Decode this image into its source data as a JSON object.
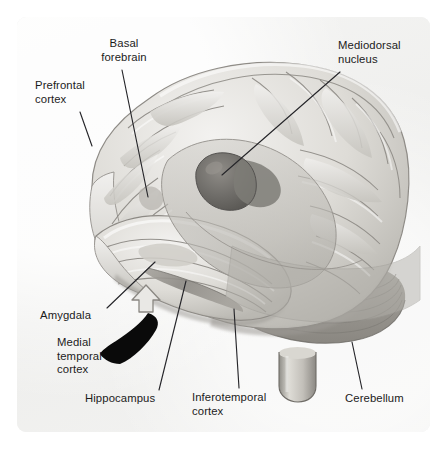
{
  "figure": {
    "background_color": "#ffffff",
    "panel_color": "#f2f2f1"
  },
  "colors": {
    "leader_line": "#26262a",
    "label_text": "#1b1b1b",
    "cortex_light": "#e8e7e4",
    "cortex_mid": "#c9c7c2",
    "cortex_shadow": "#9b9893",
    "cerebellum": "#9a9892",
    "nucleus_dark": "#6f6d69",
    "overlay_translucent": "#b9b7b1",
    "arrow_black": "#0a0a0a",
    "arrow_gray_outline": "#8d8a85"
  },
  "labels": [
    {
      "id": "basal-forebrain",
      "text": "Basal\nforebrain",
      "align": "center",
      "x": 89,
      "y": 37,
      "leader": {
        "x1": 122,
        "y1": 70,
        "x2": 148,
        "y2": 197
      }
    },
    {
      "id": "prefrontal-cortex",
      "text": "Prefrontal\ncortex",
      "align": "left",
      "x": 35,
      "y": 79,
      "leader": {
        "x1": 80,
        "y1": 112,
        "x2": 92,
        "y2": 146
      }
    },
    {
      "id": "mediodorsal-nucleus",
      "text": "Mediodorsal\nnucleus",
      "align": "left",
      "x": 338,
      "y": 39,
      "leader": {
        "x1": 340,
        "y1": 72,
        "x2": 222,
        "y2": 175
      }
    },
    {
      "id": "amygdala",
      "text": "Amygdala",
      "align": "left",
      "x": 40,
      "y": 309,
      "leader": {
        "x1": 107,
        "y1": 308,
        "x2": 155,
        "y2": 262
      }
    },
    {
      "id": "medial-temporal-cortex",
      "text": "Medial\ntemporal\ncortex",
      "align": "left",
      "x": 57,
      "y": 336,
      "wedge": {
        "x": 126,
        "y": 330,
        "w": 44,
        "h": 42
      }
    },
    {
      "id": "hippocampus",
      "text": "Hippocampus",
      "align": "left",
      "x": 85,
      "y": 392,
      "leader": {
        "x1": 159,
        "y1": 390,
        "x2": 186,
        "y2": 281
      }
    },
    {
      "id": "inferotemporal-cortex",
      "text": "Inferotemporal\ncortex",
      "align": "left",
      "x": 192,
      "y": 391,
      "leader": {
        "x1": 239,
        "y1": 388,
        "x2": 234,
        "y2": 309
      }
    },
    {
      "id": "cerebellum",
      "text": "Cerebellum",
      "align": "left",
      "x": 345,
      "y": 392,
      "leader": {
        "x1": 362,
        "y1": 389,
        "x2": 352,
        "y2": 342
      }
    }
  ],
  "structures": [
    {
      "id": "cerebral-cortex",
      "name": "Cerebral cortex (lateral view)"
    },
    {
      "id": "mediodorsal-nucleus",
      "name": "Mediodorsal nucleus of thalamus"
    },
    {
      "id": "hippocampus-band",
      "name": "Hippocampus"
    },
    {
      "id": "amygdala-body",
      "name": "Amygdala"
    },
    {
      "id": "cerebellum-body",
      "name": "Cerebellum"
    },
    {
      "id": "brainstem",
      "name": "Brainstem"
    },
    {
      "id": "translucent-overlay",
      "name": "Cut-away translucent overlay"
    },
    {
      "id": "medial-temporal-arrow",
      "name": "Medial temporal cortex pointer"
    }
  ]
}
